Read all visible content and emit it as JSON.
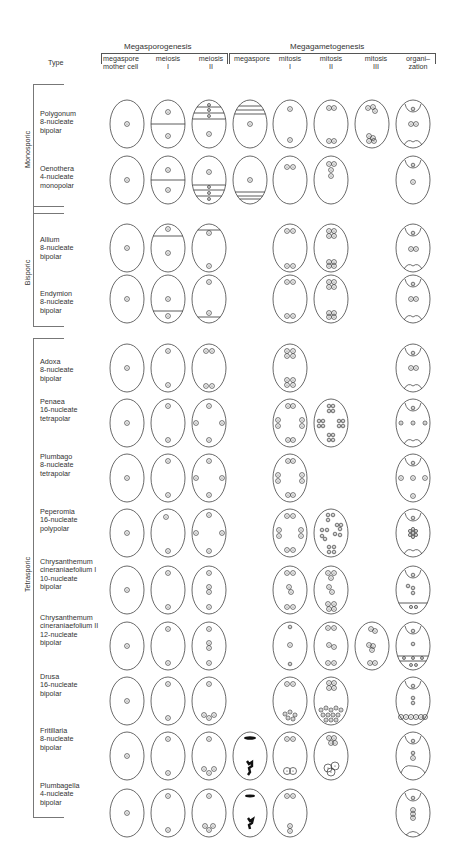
{
  "header": {
    "type_label": "Type",
    "megasporogenesis": "Megasporogenesis",
    "megagametogenesis": "Megagametogenesis",
    "columns": [
      {
        "l1": "megaspore",
        "l2": "mother cell"
      },
      {
        "l1": "meiosis",
        "l2": "I"
      },
      {
        "l1": "meiosis",
        "l2": "II"
      },
      {
        "l1": "megaspore",
        "l2": ""
      },
      {
        "l1": "mitosis",
        "l2": "I"
      },
      {
        "l1": "mitosis",
        "l2": "II"
      },
      {
        "l1": "mitosis",
        "l2": "III"
      },
      {
        "l1": "organi–",
        "l2": "zation"
      }
    ]
  },
  "groups": [
    {
      "label": "Monosporic"
    },
    {
      "label": "Bisporic"
    },
    {
      "label": "Tetrasporic"
    }
  ],
  "rows": [
    {
      "l1": "Polygonum",
      "l2": "8-nucleate",
      "l3": "bipolar",
      "l4": ""
    },
    {
      "l1": "Oenothera",
      "l2": "4-nucleate",
      "l3": "monopolar",
      "l4": ""
    },
    {
      "l1": "Allium",
      "l2": "8-nucleate",
      "l3": "bipolar",
      "l4": ""
    },
    {
      "l1": "Endymion",
      "l2": "8-nucleate",
      "l3": "bipolar",
      "l4": ""
    },
    {
      "l1": "Adoxa",
      "l2": "8-nucleate",
      "l3": "bipolar",
      "l4": ""
    },
    {
      "l1": "Penaea",
      "l2": "16-nucleate",
      "l3": "tetrapolar",
      "l4": ""
    },
    {
      "l1": "Plumbago",
      "l2": "8-nucleate",
      "l3": "tetrapolar",
      "l4": ""
    },
    {
      "l1": "Peperomia",
      "l2": "16-nucleate",
      "l3": "polypolar",
      "l4": ""
    },
    {
      "l1": "Chrysanthemum",
      "l2": "cineraniaefolium I",
      "l3": "10-nucleate",
      "l4": "bipolar"
    },
    {
      "l1": "Chrysanthemum",
      "l2": "cineraniaefolium II",
      "l3": "12-nucleate",
      "l4": "bipolar"
    },
    {
      "l1": "Drusa",
      "l2": "16-nucleate",
      "l3": "bipolar",
      "l4": ""
    },
    {
      "l1": "Fritillaria",
      "l2": "8-nucleate",
      "l3": "bipolar",
      "l4": ""
    },
    {
      "l1": "Plumbagella",
      "l2": "4-nucleate",
      "l3": "bipolar",
      "l4": ""
    }
  ],
  "colors": {
    "line": "#444444",
    "text": "#333333",
    "background": "#ffffff"
  }
}
